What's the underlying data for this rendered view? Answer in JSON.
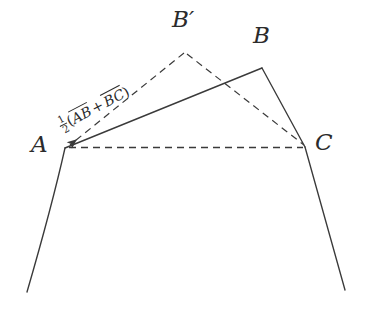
{
  "figure": {
    "kind": "geometry-diagram",
    "title_visible": false,
    "background_color": "#ffffff",
    "stroke_color": "#3a3a3a",
    "text_color": "#2b2b2b",
    "width": 370,
    "height": 322
  },
  "labels": {
    "a": "A",
    "b": "B",
    "b_prime_base": "B",
    "b_prime_mark": "′",
    "c": "C"
  },
  "formula": {
    "fraction_numerator": "1",
    "fraction_denominator": "2",
    "open_paren": "(",
    "term_one": "AB",
    "operator": "+",
    "term_two": "BC",
    "close_paren": ")",
    "plain_text": "1/2(AB→ + BC→)",
    "vector_notation": "overline-arrow"
  },
  "points": {
    "A": {
      "x": 65,
      "y": 148
    },
    "B": {
      "x": 262,
      "y": 68
    },
    "C": {
      "x": 305,
      "y": 147
    },
    "B_prime": {
      "x": 185,
      "y": 50
    },
    "left_tail": {
      "x": 27,
      "y": 292
    },
    "right_tail": {
      "x": 345,
      "y": 290
    }
  },
  "segments": {
    "solid": [
      {
        "name": "side-AB",
        "from": "A",
        "to": "B"
      },
      {
        "name": "side-BC",
        "from": "B",
        "to": "C"
      },
      {
        "name": "curve-left-from-A",
        "from": "A",
        "to": "left_tail"
      },
      {
        "name": "curve-right-from-C",
        "from": "C",
        "to": "right_tail"
      }
    ],
    "dashed": [
      {
        "name": "vector-to-A-from-Bprime",
        "from": "B_prime",
        "to": "A",
        "arrowhead_at": "A"
      },
      {
        "name": "segment-Bprime-C",
        "from": "B_prime",
        "to": "C"
      },
      {
        "name": "segment-A-C",
        "from": "A",
        "to": "C"
      }
    ],
    "dash_pattern": "7 5"
  }
}
